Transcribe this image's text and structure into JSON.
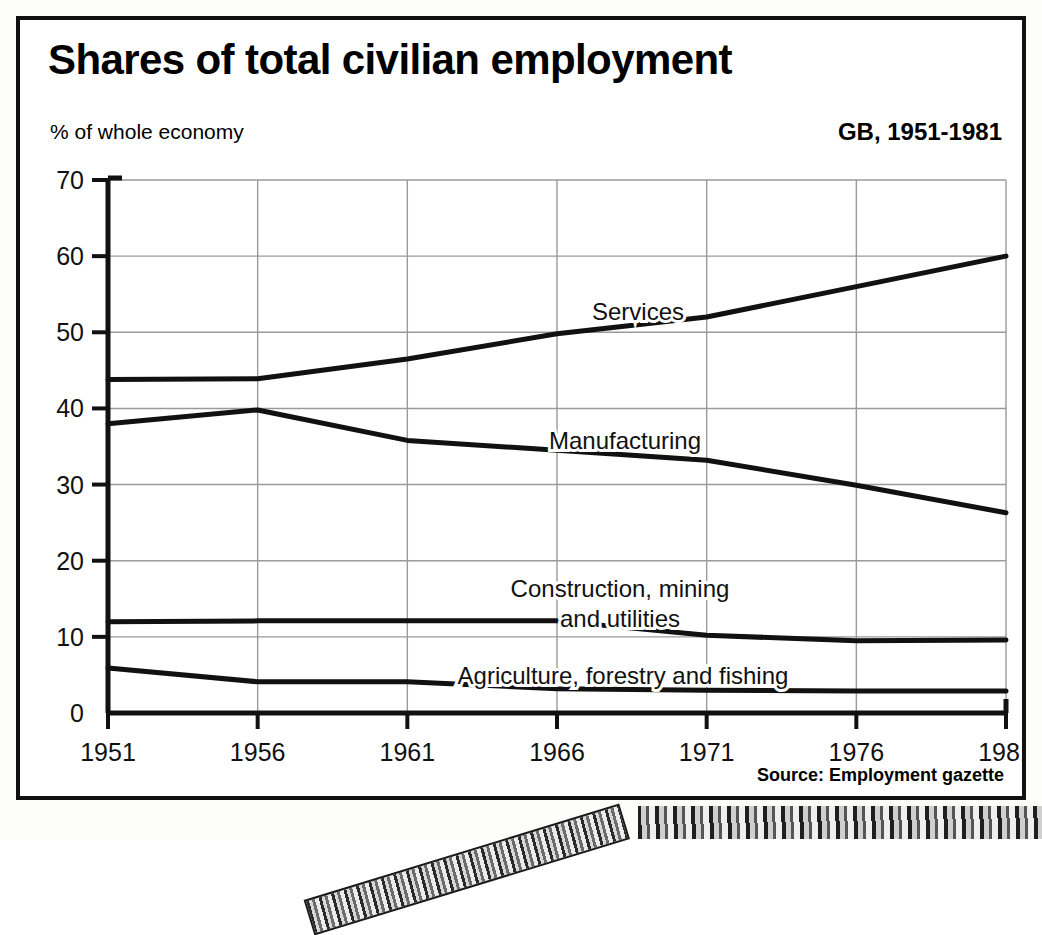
{
  "figure": {
    "title": "Shares of total civilian employment",
    "y_axis_caption": "% of whole economy",
    "region_caption": "GB, 1951-1981",
    "source": "Source: Employment gazette"
  },
  "chart_data": {
    "type": "line",
    "title": "Shares of total civilian employment",
    "subtitle": "% of whole economy",
    "annotation": "GB, 1951-1981",
    "source": "Source: Employment gazette",
    "xlabel": "",
    "ylabel": "% of whole economy",
    "x": [
      1951,
      1956,
      1961,
      1966,
      1971,
      1976,
      1981
    ],
    "xtick_labels": [
      "1951",
      "1956",
      "1961",
      "1966",
      "1971",
      "1976",
      "1981"
    ],
    "xlim": [
      1951,
      1981
    ],
    "ylim": [
      0,
      70
    ],
    "ytick_labels": [
      "0",
      "10",
      "20",
      "30",
      "40",
      "50",
      "60",
      "70"
    ],
    "yticks": [
      0,
      10,
      20,
      30,
      40,
      50,
      60,
      70
    ],
    "grid": true,
    "legend": "inline-labels",
    "series": [
      {
        "name": "Services",
        "label": "Services",
        "values": [
          43.8,
          43.9,
          46.5,
          49.8,
          52.0,
          56.0,
          60.0
        ]
      },
      {
        "name": "Manufacturing",
        "label": "Manufacturing",
        "values": [
          38.0,
          39.8,
          35.8,
          34.5,
          33.2,
          29.9,
          26.3
        ]
      },
      {
        "name": "Construction, mining and utilities",
        "label_line1": "Construction, mining",
        "label_line2": "and utilities",
        "values": [
          12.0,
          12.1,
          12.1,
          12.1,
          10.2,
          9.5,
          9.6
        ]
      },
      {
        "name": "Agriculture, forestry and fishing",
        "label": "Agriculture, forestry and fishing",
        "values": [
          5.9,
          4.1,
          4.1,
          3.2,
          3.0,
          2.9,
          2.9
        ]
      }
    ]
  },
  "colors": {
    "line": "#111111",
    "grid": "#9a9a9a",
    "axis": "#111111",
    "background": "#ffffff"
  }
}
